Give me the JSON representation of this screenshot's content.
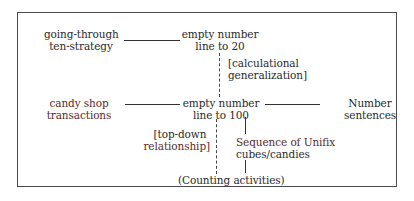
{
  "diagram": {
    "nodes": {
      "going_through": {
        "line1": "going-through",
        "line2": "ten-strategy"
      },
      "enl20": {
        "line1": "empty number",
        "line2": "line to 20"
      },
      "calc_gen": {
        "line1": "[calculational",
        "line2": "generalization]"
      },
      "candy_shop": {
        "line1": "candy shop",
        "line2": "transactions"
      },
      "enl100": {
        "line1": "empty number",
        "line2": "line to 100"
      },
      "number_sentences": {
        "line1": "Number",
        "line2": "sentences"
      },
      "top_down": {
        "line1": "[top-down",
        "line2": "relationship]"
      },
      "unifix": {
        "line1": "Sequence of Unifix",
        "line2": "cubes/candies"
      },
      "counting": {
        "line1": "(Counting activities)"
      }
    },
    "edges": [
      {
        "from": "going_through",
        "to": "enl20",
        "style": "solid"
      },
      {
        "from": "enl20",
        "to": "enl100",
        "style": "dashed",
        "label": "calc_gen"
      },
      {
        "from": "candy_shop",
        "to": "enl100",
        "style": "solid"
      },
      {
        "from": "enl100",
        "to": "number_sentences",
        "style": "solid"
      },
      {
        "from": "counting",
        "to": "enl100",
        "style": "dashed",
        "label": "top_down"
      },
      {
        "from": "counting",
        "to": "unifix",
        "style": "solid"
      },
      {
        "from": "unifix",
        "to": "enl100",
        "style": "solid"
      }
    ]
  }
}
